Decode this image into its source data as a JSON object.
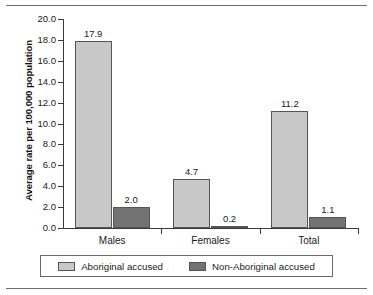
{
  "chart_data": {
    "type": "bar",
    "title": "",
    "subtitle": "",
    "xlabel": "",
    "ylabel": "Average rate per 100,000 population",
    "categories": [
      "Males",
      "Females",
      "Total"
    ],
    "series": [
      {
        "name": "Aboriginal accused",
        "color": "#c8c8c8",
        "values": [
          17.9,
          4.7,
          11.2
        ],
        "labels": [
          "17.9",
          "4.7",
          "11.2"
        ]
      },
      {
        "name": "Non-Aboriginal accused",
        "color": "#737373",
        "values": [
          2.0,
          0.2,
          1.1
        ],
        "labels": [
          "2.0",
          "0.2",
          "1.1"
        ]
      }
    ],
    "ylim": [
      0.0,
      20.0
    ],
    "ytick_step": 2.0,
    "yticks": [
      "0.0",
      "2.0",
      "4.0",
      "6.0",
      "8.0",
      "10.0",
      "12.0",
      "14.0",
      "16.0",
      "18.0",
      "20.0"
    ],
    "grid": false,
    "legend_position": "bottom",
    "data_labels_shown": true
  },
  "legend": {
    "entries": [
      {
        "label": "Aboriginal accused",
        "swatch": "legend-swatch-aboriginal"
      },
      {
        "label": "Non-Aboriginal accused",
        "swatch": "legend-swatch-non-aboriginal"
      }
    ]
  },
  "axis": {
    "y_title": "Average rate per 100,000 population"
  }
}
